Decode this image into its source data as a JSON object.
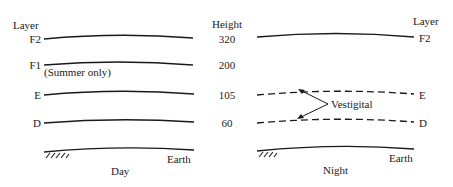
{
  "day_panel": {
    "header": "Layer",
    "caption": "Day",
    "layers": [
      {
        "name": "F2"
      },
      {
        "name": "F1",
        "note": "(Summer only)"
      },
      {
        "name": "E"
      },
      {
        "name": "D"
      }
    ],
    "ground_label": "Earth"
  },
  "height_column": {
    "header": "Height",
    "values": [
      "320",
      "200",
      "105",
      "60"
    ]
  },
  "night_panel": {
    "header": "Layer",
    "caption": "Night",
    "layers": [
      {
        "name": "F2",
        "style": "solid"
      },
      {
        "name": "E",
        "style": "dashed"
      },
      {
        "name": "D",
        "style": "dashed"
      }
    ],
    "annotation": "Vestigital",
    "ground_label": "Earth"
  },
  "colors": {
    "ink": "#1a1a1a",
    "background": "#ffffff"
  }
}
